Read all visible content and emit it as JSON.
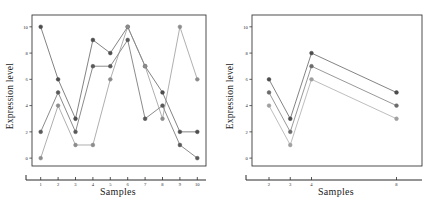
{
  "figure": {
    "background": "#ffffff",
    "panel_count": 2
  },
  "chart_data": [
    {
      "type": "line",
      "panel": "left",
      "title": "",
      "xlabel": "Samples",
      "ylabel": "Expression level",
      "x": [
        1,
        2,
        3,
        4,
        5,
        6,
        7,
        8,
        9,
        10
      ],
      "xticklabels": [
        "1",
        "2",
        "3",
        "4",
        "5",
        "6",
        "7",
        "8",
        "9",
        "10"
      ],
      "yticklabels": [
        "0",
        "2",
        "4",
        "6",
        "8",
        "10"
      ],
      "yticks": [
        0,
        2,
        4,
        6,
        8,
        10
      ],
      "xlim": [
        0.5,
        10.5
      ],
      "ylim": [
        -0.6,
        10.9
      ],
      "grid": false,
      "legend": "none",
      "marker": "circle",
      "series": [
        {
          "name": "series-1",
          "color": "#4d4d4d",
          "values": [
            10,
            6,
            3,
            9,
            8,
            10,
            7,
            5,
            2,
            2
          ]
        },
        {
          "name": "series-2",
          "color": "#595959",
          "values": [
            2,
            5,
            2,
            7,
            7,
            9,
            3,
            4,
            1,
            0
          ]
        },
        {
          "name": "series-3",
          "color": "#8c8c8c",
          "values": [
            0,
            4,
            1,
            1,
            6,
            10,
            7,
            3,
            10,
            6
          ]
        }
      ]
    },
    {
      "type": "line",
      "panel": "right",
      "title": "",
      "xlabel": "Samples",
      "ylabel": "Expression level",
      "x": [
        2,
        3,
        4,
        8
      ],
      "xticklabels": [
        "2",
        "3",
        "4",
        "8"
      ],
      "yticklabels": [
        "0",
        "2",
        "4",
        "6",
        "8",
        "10"
      ],
      "yticks": [
        0,
        2,
        4,
        6,
        8,
        10
      ],
      "xlim": [
        1.2,
        9.2
      ],
      "ylim": [
        -0.6,
        10.9
      ],
      "grid": false,
      "legend": "none",
      "marker": "circle",
      "series": [
        {
          "name": "series-1",
          "color": "#4d4d4d",
          "values": [
            6,
            3,
            8,
            5
          ]
        },
        {
          "name": "series-2",
          "color": "#6b6b6b",
          "values": [
            5,
            2,
            7,
            4
          ]
        },
        {
          "name": "series-3",
          "color": "#a0a0a0",
          "values": [
            4,
            1,
            6,
            3
          ]
        }
      ]
    }
  ]
}
